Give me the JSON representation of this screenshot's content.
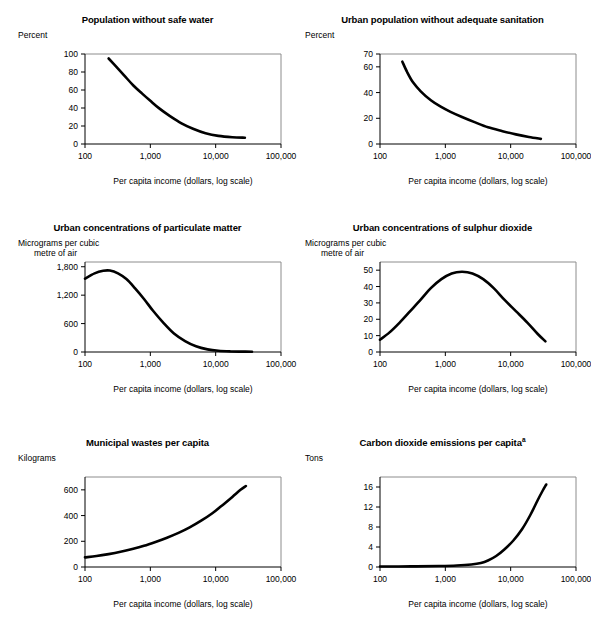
{
  "figure": {
    "xlabel": "Per capita income (dollars, log scale)",
    "xticks": [
      "100",
      "1,000",
      "10,000",
      "100,000"
    ],
    "xlim": [
      100,
      100000
    ],
    "curve_color": "#000000",
    "frame_color": "#8c8c8c"
  },
  "chart_data": [
    {
      "type": "line",
      "title": "Population without safe water",
      "ylabel": "Percent",
      "ylabel_line2": "",
      "xlabel": "Per capita income (dollars, log scale)",
      "ylim": [
        0,
        100
      ],
      "yticks": [
        0,
        20,
        40,
        60,
        80,
        100
      ],
      "ytick_labels": [
        "0",
        "20",
        "40",
        "60",
        "80",
        "100"
      ],
      "xlim": [
        100,
        100000
      ],
      "xticks": [
        100,
        1000,
        10000,
        100000
      ],
      "xtick_labels": [
        "100",
        "1,000",
        "10,000",
        "100,000"
      ],
      "grid": false,
      "legend": "none",
      "x": [
        230,
        300,
        400,
        550,
        750,
        1000,
        1400,
        2000,
        3000,
        4500,
        7000,
        11000,
        18000,
        28000
      ],
      "y": [
        95,
        86,
        76,
        65,
        56,
        48,
        39,
        31,
        23,
        17,
        12,
        9,
        7.5,
        7
      ]
    },
    {
      "type": "line",
      "title": "Urban population without adequate sanitation",
      "ylabel": "Percent",
      "ylabel_line2": "",
      "xlabel": "Per capita income (dollars, log scale)",
      "ylim": [
        0,
        70
      ],
      "yticks": [
        0,
        20,
        40,
        60,
        70
      ],
      "ytick_labels": [
        "0",
        "20",
        "40",
        "60",
        "70"
      ],
      "xlim": [
        100,
        100000
      ],
      "xticks": [
        100,
        1000,
        10000,
        100000
      ],
      "xtick_labels": [
        "100",
        "1,000",
        "10,000",
        "100,000"
      ],
      "grid": false,
      "legend": "none",
      "x": [
        220,
        260,
        320,
        420,
        600,
        850,
        1200,
        1800,
        2800,
        4500,
        7500,
        12000,
        19000,
        29000
      ],
      "y": [
        64,
        56,
        48,
        41,
        34,
        29,
        25,
        21,
        17,
        13,
        10,
        7.5,
        5.5,
        4
      ]
    },
    {
      "type": "line",
      "title": "Urban concentrations of particulate matter",
      "ylabel": "Micrograms per cubic",
      "ylabel_line2": "metre of air",
      "xlabel": "Per capita income (dollars, log scale)",
      "ylim": [
        0,
        1900
      ],
      "yticks": [
        0,
        600,
        1200,
        1800
      ],
      "ytick_labels": [
        "0",
        "600",
        "1,200",
        "1,800"
      ],
      "xlim": [
        100,
        100000
      ],
      "xticks": [
        100,
        1000,
        10000,
        100000
      ],
      "xtick_labels": [
        "100",
        "1,000",
        "10,000",
        "100,000"
      ],
      "grid": false,
      "legend": "none",
      "x": [
        100,
        140,
        190,
        240,
        320,
        430,
        580,
        800,
        1100,
        1600,
        2300,
        3400,
        5000,
        7500,
        11000,
        17000,
        25000,
        36000
      ],
      "y": [
        1550,
        1660,
        1715,
        1720,
        1660,
        1540,
        1350,
        1120,
        870,
        610,
        390,
        230,
        120,
        55,
        25,
        12,
        8,
        6
      ]
    },
    {
      "type": "line",
      "title": "Urban concentrations of sulphur dioxide",
      "ylabel": "Micrograms per cubic",
      "ylabel_line2": "metre of air",
      "xlabel": "Per capita income (dollars, log scale)",
      "ylim": [
        0,
        55
      ],
      "yticks": [
        0,
        10,
        20,
        30,
        40,
        50
      ],
      "ytick_labels": [
        "0",
        "10",
        "20",
        "30",
        "40",
        "50"
      ],
      "xlim": [
        100,
        100000
      ],
      "xticks": [
        100,
        1000,
        10000,
        100000
      ],
      "xtick_labels": [
        "100",
        "1,000",
        "10,000",
        "100,000"
      ],
      "grid": false,
      "legend": "none",
      "x": [
        100,
        140,
        200,
        290,
        420,
        600,
        870,
        1250,
        1800,
        2600,
        3800,
        5500,
        8000,
        12000,
        18000,
        26000,
        34000
      ],
      "y": [
        7.5,
        12,
        18,
        25,
        32,
        39,
        44.5,
        48,
        49,
        48,
        44.5,
        39,
        32,
        25,
        18,
        11,
        6.5
      ]
    },
    {
      "type": "line",
      "title": "Municipal wastes per capita",
      "ylabel": "Kilograms",
      "ylabel_line2": "",
      "xlabel": "Per capita income (dollars, log scale)",
      "ylim": [
        0,
        700
      ],
      "yticks": [
        0,
        200,
        400,
        600
      ],
      "ytick_labels": [
        "0",
        "200",
        "400",
        "600"
      ],
      "xlim": [
        100,
        100000
      ],
      "xticks": [
        100,
        1000,
        10000,
        100000
      ],
      "xtick_labels": [
        "100",
        "1,000",
        "10,000",
        "100,000"
      ],
      "grid": false,
      "legend": "none",
      "x": [
        100,
        150,
        230,
        350,
        530,
        800,
        1200,
        1800,
        2700,
        4000,
        6000,
        9000,
        13000,
        18000,
        24000,
        29000
      ],
      "y": [
        75,
        85,
        100,
        118,
        140,
        165,
        195,
        228,
        265,
        308,
        360,
        420,
        485,
        545,
        600,
        630
      ]
    },
    {
      "type": "line",
      "title": "Carbon dioxide emissions per capita",
      "title_superscript": "a",
      "ylabel": "Tons",
      "ylabel_line2": "",
      "xlabel": "Per capita income (dollars, log scale)",
      "ylim": [
        0,
        18
      ],
      "yticks": [
        0,
        4,
        8,
        12,
        16
      ],
      "ytick_labels": [
        "0",
        "4",
        "8",
        "12",
        "16"
      ],
      "xlim": [
        100,
        100000
      ],
      "xticks": [
        100,
        1000,
        10000,
        100000
      ],
      "xtick_labels": [
        "100",
        "1,000",
        "10,000",
        "100,000"
      ],
      "grid": false,
      "legend": "none",
      "x": [
        100,
        300,
        800,
        1500,
        2500,
        3500,
        4500,
        6000,
        8000,
        11000,
        15000,
        20000,
        26000,
        31000,
        35000
      ],
      "y": [
        0.1,
        0.12,
        0.2,
        0.3,
        0.5,
        0.8,
        1.3,
        2.2,
        3.5,
        5.3,
        7.6,
        10.4,
        13.4,
        15.3,
        16.5
      ]
    }
  ]
}
